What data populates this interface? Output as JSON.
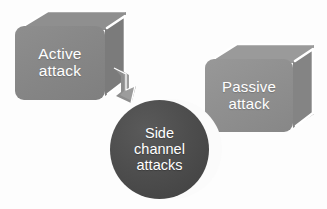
{
  "diagram": {
    "background_color": "#fdfdfd",
    "nodes": [
      {
        "id": "active-attack",
        "label": "Active\nattack",
        "shape": "3d-box",
        "fill_color": "#878787",
        "text_color": "#ffffff"
      },
      {
        "id": "passive-attack",
        "label": "Passive\nattack",
        "shape": "3d-box",
        "fill_color": "#909090",
        "text_color": "#ffffff"
      },
      {
        "id": "side-channel-attacks",
        "label": "Side\nchannel\nattacks",
        "shape": "3d-circle",
        "fill_color": "#4a4a4a",
        "text_color": "#ffffff"
      }
    ],
    "connectors": [
      {
        "id": "active-to-side-channel",
        "from": "active-attack",
        "to": "side-channel-attacks",
        "style": "bent-arrow",
        "color": "#8d8d8d"
      }
    ]
  }
}
